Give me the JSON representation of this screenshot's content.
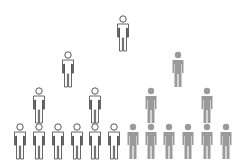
{
  "diagram": {
    "type": "pyramid-population",
    "colors": {
      "outline": "#555555",
      "filled": "#9a9a9a",
      "background": "#ffffff"
    },
    "levels": [
      {
        "level": 1,
        "figures": [
          {
            "x": 123,
            "y": 15,
            "style": "outline"
          }
        ]
      },
      {
        "level": 2,
        "figures": [
          {
            "x": 68,
            "y": 51,
            "style": "outline"
          },
          {
            "x": 178,
            "y": 51,
            "style": "filled"
          }
        ]
      },
      {
        "level": 3,
        "figures": [
          {
            "x": 39,
            "y": 87,
            "style": "outline"
          },
          {
            "x": 95,
            "y": 87,
            "style": "outline"
          },
          {
            "x": 151,
            "y": 87,
            "style": "filled"
          },
          {
            "x": 207,
            "y": 87,
            "style": "filled"
          }
        ]
      },
      {
        "level": 4,
        "figures": [
          {
            "x": 20,
            "y": 123,
            "style": "outline"
          },
          {
            "x": 39,
            "y": 123,
            "style": "outline"
          },
          {
            "x": 58,
            "y": 123,
            "style": "outline"
          },
          {
            "x": 77,
            "y": 123,
            "style": "outline"
          },
          {
            "x": 95,
            "y": 123,
            "style": "outline"
          },
          {
            "x": 114,
            "y": 123,
            "style": "outline"
          },
          {
            "x": 133,
            "y": 123,
            "style": "filled"
          },
          {
            "x": 151,
            "y": 123,
            "style": "filled"
          },
          {
            "x": 169,
            "y": 123,
            "style": "filled"
          },
          {
            "x": 188,
            "y": 123,
            "style": "filled"
          },
          {
            "x": 207,
            "y": 123,
            "style": "filled"
          },
          {
            "x": 226,
            "y": 123,
            "style": "filled"
          }
        ]
      }
    ],
    "counts": {
      "outline": 9,
      "filled": 9,
      "total": 19
    }
  }
}
